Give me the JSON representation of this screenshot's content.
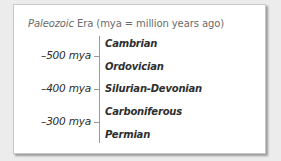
{
  "diagram": {
    "title_prefix": "Paleozoic",
    "title_rest": " Era (mya = million years ago)",
    "timeline": {
      "markers": [
        {
          "label": "–500 mya",
          "y": 51
        },
        {
          "label": "–400 mya",
          "y": 84
        },
        {
          "label": "–300 mya",
          "y": 117
        }
      ],
      "periods": [
        {
          "label": "Cambrian",
          "y": 33
        },
        {
          "label": "Ordovician",
          "y": 56
        },
        {
          "label": "Silurian-Devonian",
          "y": 79
        },
        {
          "label": "Carboniferous",
          "y": 102
        },
        {
          "label": "Permian",
          "y": 125
        }
      ]
    }
  }
}
